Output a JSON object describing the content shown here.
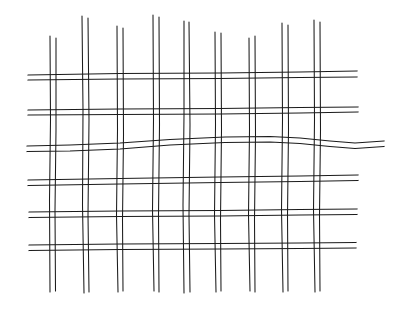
{
  "figure": {
    "description": "Hand-drawn line illustration of a plain-weave wire mesh screen, showing nine vertical strands interlacing with six horizontal strands.",
    "canvas": {
      "width": 405,
      "height": 318,
      "background_color": "#ffffff"
    },
    "style": {
      "ink_color": "#1b1b1b",
      "stroke_width": 1.25,
      "strand_gap": 5,
      "technique": "double-line pen sketch"
    },
    "counts": {
      "vertical_strands": 9,
      "horizontal_strands": 6,
      "lines_per_strand": 2,
      "total_lines": 30
    },
    "vertical_strands": [
      {
        "id": "v1",
        "x_top": 50,
        "x_bottom": 53,
        "y_start": 36,
        "y_end": 292,
        "gap": 5
      },
      {
        "id": "v2",
        "x_top": 83,
        "x_bottom": 86,
        "y_start": 16,
        "y_end": 293,
        "gap": 6
      },
      {
        "id": "v3",
        "x_top": 117,
        "x_bottom": 120,
        "y_start": 26,
        "y_end": 292,
        "gap": 5
      },
      {
        "id": "v4",
        "x_top": 153,
        "x_bottom": 156,
        "y_start": 15,
        "y_end": 291,
        "gap": 6
      },
      {
        "id": "v5",
        "x_top": 184,
        "x_bottom": 186,
        "y_start": 21,
        "y_end": 293,
        "gap": 5
      },
      {
        "id": "v6",
        "x_top": 215,
        "x_bottom": 218,
        "y_start": 32,
        "y_end": 292,
        "gap": 5
      },
      {
        "id": "v7",
        "x_top": 249,
        "x_bottom": 252,
        "y_start": 38,
        "y_end": 291,
        "gap": 5
      },
      {
        "id": "v8",
        "x_top": 282,
        "x_bottom": 284,
        "y_start": 23,
        "y_end": 292,
        "gap": 5
      },
      {
        "id": "v9",
        "x_top": 314,
        "x_bottom": 317,
        "y_start": 20,
        "y_end": 292,
        "gap": 5
      }
    ],
    "horizontal_strands": [
      {
        "id": "h1",
        "y_left": 75,
        "y_right": 72,
        "x_start": 28,
        "x_end": 357,
        "gap": 5,
        "wavy": false
      },
      {
        "id": "h2",
        "y_left": 110,
        "y_right": 108,
        "x_start": 28,
        "x_end": 358,
        "gap": 5,
        "wavy": false
      },
      {
        "id": "h3",
        "y_left": 146,
        "y_right": 141,
        "x_start": 27,
        "x_end": 384,
        "gap": 5,
        "wavy": true
      },
      {
        "id": "h4",
        "y_left": 180,
        "y_right": 175,
        "x_start": 28,
        "x_end": 358,
        "gap": 5,
        "wavy": false
      },
      {
        "id": "h5",
        "y_left": 212,
        "y_right": 209,
        "x_start": 29,
        "x_end": 357,
        "gap": 5,
        "wavy": false
      },
      {
        "id": "h6",
        "y_left": 245,
        "y_right": 243,
        "x_start": 29,
        "x_end": 356,
        "gap": 5,
        "wavy": false
      }
    ],
    "paths": {
      "v1a": "M 50 36 L 50.5 120 L 49.5 200 L 50 292",
      "v1b": "M 56 38 L 56 130 L 55 210 L 55.5 291",
      "v2a": "M 82 16 L 83 110 L 82.5 205 L 84 293",
      "v2b": "M 88 18 L 89 120 L 88 215 L 89 292",
      "v3a": "M 117 26 L 117.5 130 L 116.5 215 L 118 292",
      "v3b": "M 123 28 L 123.5 135 L 122.5 220 L 123 291",
      "v4a": "M 153 15 L 153.5 120 L 152.5 210 L 154 291",
      "v4b": "M 159 17 L 159.5 125 L 158.5 215 L 159 292",
      "v5a": "M 184 21 L 184 115 L 183 205 L 184 293",
      "v5b": "M 189 22 L 190 125 L 189 215 L 190 292",
      "v6a": "M 215 32 L 215.5 125 L 214.5 215 L 216 292",
      "v6b": "M 221 33 L 221.5 130 L 220.5 220 L 221 291",
      "v7a": "M 249 38 L 249.5 130 L 248.5 215 L 250 291",
      "v7b": "M 255 36 L 255.5 135 L 254.5 220 L 255 292",
      "v8a": "M 282 23 L 282.5 120 L 281.5 210 L 283 292",
      "v8b": "M 288 25 L 288.5 130 L 287.5 215 L 288 291",
      "v9a": "M 314 20 L 314.5 120 L 313.5 210 L 315 292",
      "v9b": "M 320 22 L 320.5 130 L 319.5 215 L 320 291",
      "h1a": "M 28 75 L 120 73.5 L 220 73 L 300 72 L 357 71",
      "h1b": "M 28 80 L 120 79 L 220 78.5 L 300 77.5 L 357 77",
      "h2a": "M 28 110 L 120 109 L 220 108.5 L 300 107.5 L 358 107",
      "h2b": "M 28 115 L 120 114.5 L 220 114 L 300 113 L 358 112",
      "h3a": "M 27 146 L 70 145 L 120 143 L 170 139.5 L 225 137 L 270 136.5 L 300 138 L 330 141 L 355 143 L 384 141",
      "h3b": "M 27 151.5 L 70 151 L 120 149 L 170 145 L 225 142.5 L 270 142 L 300 143.5 L 330 146.5 L 355 148.5 L 384 146.5",
      "h4a": "M 28 180 L 120 178.5 L 220 177 L 300 176 L 358 175",
      "h4b": "M 28 185.5 L 120 184 L 220 182.5 L 300 181.5 L 358 180.5",
      "h5a": "M 29 212 L 120 211 L 220 210.5 L 300 209.5 L 357 209",
      "h5b": "M 29 217.5 L 120 216.5 L 220 216 L 300 215 L 357 214.5",
      "h6a": "M 29 245 L 120 244 L 220 243.5 L 300 243 L 356 242.5",
      "h6b": "M 29 250.5 L 120 249.5 L 220 249 L 300 248.5 L 356 248"
    }
  }
}
